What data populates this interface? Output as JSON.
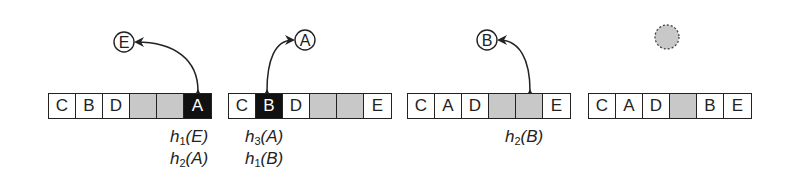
{
  "diagram": {
    "steps": [
      {
        "cells": [
          {
            "key": "C",
            "state": "filled"
          },
          {
            "key": "B",
            "state": "filled"
          },
          {
            "key": "D",
            "state": "filled"
          },
          {
            "key": "",
            "state": "empty"
          },
          {
            "key": "",
            "state": "empty"
          },
          {
            "key": "A",
            "state": "highlight"
          }
        ],
        "incoming": "E",
        "labels": [
          {
            "h": "h",
            "sub": "1",
            "arg": "(E)"
          },
          {
            "h": "h",
            "sub": "2",
            "arg": "(A)"
          }
        ]
      },
      {
        "cells": [
          {
            "key": "C",
            "state": "filled"
          },
          {
            "key": "B",
            "state": "highlight"
          },
          {
            "key": "D",
            "state": "filled"
          },
          {
            "key": "",
            "state": "empty"
          },
          {
            "key": "",
            "state": "empty"
          },
          {
            "key": "E",
            "state": "filled"
          }
        ],
        "incoming": "A",
        "labels": [
          {
            "h": "h",
            "sub": "3",
            "arg": "(A)"
          },
          {
            "h": "h",
            "sub": "1",
            "arg": "(B)"
          }
        ]
      },
      {
        "cells": [
          {
            "key": "C",
            "state": "filled"
          },
          {
            "key": "A",
            "state": "filled"
          },
          {
            "key": "D",
            "state": "filled"
          },
          {
            "key": "",
            "state": "empty"
          },
          {
            "key": "",
            "state": "empty"
          },
          {
            "key": "E",
            "state": "filled"
          }
        ],
        "incoming": "B",
        "labels": [
          {
            "h": "h",
            "sub": "2",
            "arg": "(B)"
          }
        ]
      },
      {
        "cells": [
          {
            "key": "C",
            "state": "filled"
          },
          {
            "key": "A",
            "state": "filled"
          },
          {
            "key": "D",
            "state": "filled"
          },
          {
            "key": "",
            "state": "empty"
          },
          {
            "key": "B",
            "state": "filled"
          },
          {
            "key": "E",
            "state": "filled"
          }
        ],
        "incoming": "",
        "labels": []
      }
    ],
    "colors": {
      "empty": "#c8c8c8",
      "highlight": "#111111",
      "stroke": "#222222"
    }
  }
}
